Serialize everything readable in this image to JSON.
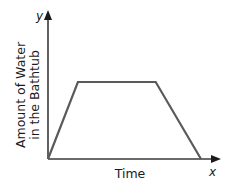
{
  "chart_data": {
    "type": "line",
    "title": "",
    "xlabel": "Time",
    "ylabel": "Amount of Water in the Bathtub",
    "ylabel_lines": [
      "Amount of Water",
      "in the Bathtub"
    ],
    "x_axis_letter": "x",
    "y_axis_letter": "y",
    "grid": false,
    "legend": null,
    "ticks": {
      "x": [],
      "y": []
    },
    "series": [
      {
        "name": "Amount of water",
        "description": "Increases linearly, stays constant, then decreases linearly to zero",
        "points": [
          {
            "x": 0,
            "y": 0
          },
          {
            "x": 0.175,
            "y": 1
          },
          {
            "x": 0.63,
            "y": 1
          },
          {
            "x": 0.895,
            "y": 0
          }
        ]
      }
    ],
    "xlim": [
      0,
      1
    ],
    "ylim": [
      0,
      1.0
    ],
    "normalized": true,
    "colors": {
      "line": "#5a5a5a",
      "axes": "#3a3a3a",
      "text": "#1a1a1a"
    }
  }
}
